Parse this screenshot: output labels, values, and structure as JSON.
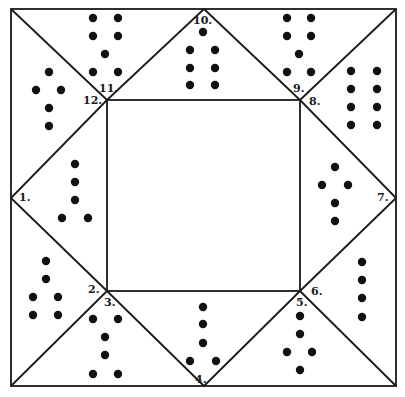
{
  "figure": {
    "colors": {
      "line": "#1a1a1a",
      "dot": "#111111",
      "background": "#ffffff"
    },
    "outer_box": {
      "x1": 11,
      "y1": 9,
      "x2": 396,
      "y2": 386
    },
    "inner_box": {
      "x1": 107,
      "y1": 100,
      "x2": 300,
      "y2": 291
    },
    "labels": [
      {
        "id": "1",
        "text": "1.",
        "x": 19,
        "y": 201
      },
      {
        "id": "2",
        "text": "2.",
        "x": 88,
        "y": 293
      },
      {
        "id": "3",
        "text": "3.",
        "x": 104,
        "y": 306
      },
      {
        "id": "4",
        "text": "4.",
        "x": 195,
        "y": 383
      },
      {
        "id": "5",
        "text": "5.",
        "x": 296,
        "y": 306
      },
      {
        "id": "6",
        "text": "6.",
        "x": 311,
        "y": 295
      },
      {
        "id": "7",
        "text": "7.",
        "x": 377,
        "y": 201
      },
      {
        "id": "8",
        "text": "8.",
        "x": 309,
        "y": 105
      },
      {
        "id": "9",
        "text": "9.",
        "x": 293,
        "y": 92
      },
      {
        "id": "10",
        "text": "10.",
        "x": 193,
        "y": 24
      },
      {
        "id": "11",
        "text": "11.",
        "x": 99,
        "y": 92
      },
      {
        "id": "12",
        "text": "12.",
        "x": 83,
        "y": 104
      }
    ],
    "regions": [
      {
        "id": "1",
        "dots": [
          [
            75,
            164
          ],
          [
            75,
            182
          ],
          [
            75,
            200
          ],
          [
            62,
            218
          ],
          [
            88,
            218
          ]
        ]
      },
      {
        "id": "2",
        "dots": [
          [
            46,
            261
          ],
          [
            46,
            279
          ],
          [
            33,
            297
          ],
          [
            58,
            297
          ],
          [
            33,
            315
          ],
          [
            58,
            315
          ]
        ]
      },
      {
        "id": "3",
        "dots": [
          [
            93,
            319
          ],
          [
            118,
            319
          ],
          [
            105,
            337
          ],
          [
            105,
            355
          ],
          [
            93,
            374
          ],
          [
            118,
            374
          ]
        ]
      },
      {
        "id": "4",
        "dots": [
          [
            203,
            307
          ],
          [
            203,
            324
          ],
          [
            203,
            343
          ],
          [
            190,
            361
          ],
          [
            216,
            361
          ]
        ]
      },
      {
        "id": "5",
        "dots": [
          [
            300,
            316
          ],
          [
            300,
            334
          ],
          [
            287,
            352
          ],
          [
            312,
            352
          ],
          [
            300,
            370
          ]
        ]
      },
      {
        "id": "6",
        "dots": [
          [
            362,
            262
          ],
          [
            362,
            280
          ],
          [
            362,
            298
          ],
          [
            362,
            317
          ]
        ]
      },
      {
        "id": "7",
        "dots": [
          [
            335,
            167
          ],
          [
            322,
            185
          ],
          [
            348,
            185
          ],
          [
            335,
            203
          ],
          [
            335,
            221
          ]
        ]
      },
      {
        "id": "8",
        "dots": [
          [
            351,
            71
          ],
          [
            377,
            71
          ],
          [
            351,
            89
          ],
          [
            377,
            89
          ],
          [
            351,
            107
          ],
          [
            377,
            107
          ],
          [
            351,
            125
          ],
          [
            377,
            125
          ]
        ]
      },
      {
        "id": "9",
        "dots": [
          [
            287,
            18
          ],
          [
            311,
            18
          ],
          [
            287,
            36
          ],
          [
            311,
            36
          ],
          [
            299,
            54
          ],
          [
            287,
            72
          ],
          [
            311,
            72
          ]
        ]
      },
      {
        "id": "10",
        "dots": [
          [
            203,
            32
          ],
          [
            190,
            50
          ],
          [
            215,
            50
          ],
          [
            190,
            68
          ],
          [
            215,
            68
          ],
          [
            190,
            85
          ],
          [
            215,
            85
          ]
        ]
      },
      {
        "id": "11",
        "dots": [
          [
            93,
            18
          ],
          [
            118,
            18
          ],
          [
            93,
            36
          ],
          [
            118,
            36
          ],
          [
            105,
            54
          ],
          [
            93,
            72
          ],
          [
            118,
            72
          ]
        ]
      },
      {
        "id": "12",
        "dots": [
          [
            49,
            72
          ],
          [
            36,
            90
          ],
          [
            61,
            90
          ],
          [
            49,
            108
          ],
          [
            49,
            126
          ]
        ]
      }
    ]
  }
}
